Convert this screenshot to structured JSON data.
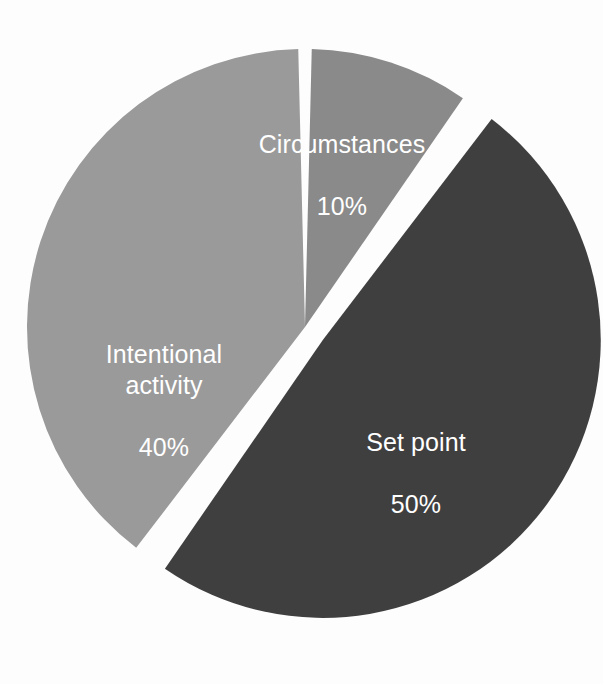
{
  "figure": {
    "background_color": "#fdfdfd",
    "label_text_color": "#ffffff"
  },
  "chart_data": {
    "type": "pie",
    "title": "",
    "subtitle": "",
    "xlabel": "",
    "ylabel": "",
    "grid": false,
    "legend_position": "none",
    "labels_inside_slices": true,
    "total": 100,
    "units": "%",
    "start_angle_deg": 0,
    "direction": "clockwise",
    "categories": [
      "Circumstances",
      "Set point",
      "Intentional activity"
    ],
    "values": [
      10,
      50,
      40
    ],
    "colors": [
      "#8a8a8a",
      "#3f3f3f",
      "#9a9a9a"
    ],
    "slices": [
      {
        "name": "Circumstances",
        "value": 10,
        "value_label": "10%",
        "color": "#8a8a8a",
        "start_angle_deg": 0,
        "end_angle_deg": 36,
        "exploded": false,
        "explode_offset_px": 0
      },
      {
        "name": "Set point",
        "value": 50,
        "value_label": "50%",
        "color": "#3f3f3f",
        "start_angle_deg": 36,
        "end_angle_deg": 216,
        "exploded": true,
        "explode_offset_px": 22
      },
      {
        "name": "Intentional activity",
        "value": 40,
        "value_label": "40%",
        "color": "#9a9a9a",
        "start_angle_deg": 216,
        "end_angle_deg": 360,
        "exploded": false,
        "explode_offset_px": 0
      }
    ]
  },
  "labels": {
    "circumstances": {
      "name": "Circumstances",
      "value": "10%"
    },
    "setpoint": {
      "name": "Set point",
      "value": "50%"
    },
    "intentional": {
      "name": "Intentional\nactivity",
      "value": "40%"
    }
  }
}
